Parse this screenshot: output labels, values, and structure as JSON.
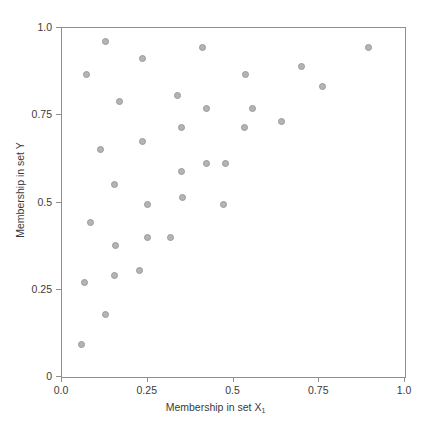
{
  "chart_data": {
    "type": "scatter",
    "title": "",
    "xlabel": "Membership in set X",
    "xlabel_subscript": "1",
    "ylabel": "Membership in set Y",
    "xlim": [
      0.0,
      1.0
    ],
    "ylim": [
      0.0,
      1.0
    ],
    "xticks": [
      0.0,
      0.25,
      0.5,
      0.75,
      1.0
    ],
    "yticks": [
      0.0,
      0.25,
      0.5,
      0.75,
      1.0
    ],
    "xtick_labels": [
      "0.0",
      "0.25",
      "0.5",
      "0.75",
      "1.0"
    ],
    "ytick_labels": [
      "0",
      "0.25",
      "0.5",
      "0.75",
      "1.0"
    ],
    "grid": false,
    "legend": null,
    "marker_color": "#b4b4b4",
    "marker_edge_color": "#9a9a9a",
    "marker_size": 7,
    "axis_color": "#8f8f8f",
    "background": "#ffffff",
    "series": [
      {
        "name": "points",
        "points": [
          [
            0.128,
            0.96
          ],
          [
            0.236,
            0.914
          ],
          [
            0.411,
            0.943
          ],
          [
            0.893,
            0.943
          ],
          [
            0.07,
            0.868
          ],
          [
            0.536,
            0.868
          ],
          [
            0.697,
            0.89
          ],
          [
            0.76,
            0.832
          ],
          [
            0.169,
            0.79
          ],
          [
            0.338,
            0.806
          ],
          [
            0.42,
            0.768
          ],
          [
            0.554,
            0.768
          ],
          [
            0.236,
            0.676
          ],
          [
            0.347,
            0.716
          ],
          [
            0.531,
            0.716
          ],
          [
            0.641,
            0.733
          ],
          [
            0.111,
            0.653
          ],
          [
            0.152,
            0.551
          ],
          [
            0.347,
            0.588
          ],
          [
            0.42,
            0.611
          ],
          [
            0.478,
            0.611
          ],
          [
            0.248,
            0.493
          ],
          [
            0.35,
            0.513
          ],
          [
            0.472,
            0.493
          ],
          [
            0.082,
            0.444
          ],
          [
            0.155,
            0.378
          ],
          [
            0.248,
            0.401
          ],
          [
            0.315,
            0.401
          ],
          [
            0.067,
            0.272
          ],
          [
            0.152,
            0.292
          ],
          [
            0.225,
            0.304
          ],
          [
            0.126,
            0.178
          ],
          [
            0.058,
            0.092
          ]
        ]
      }
    ]
  }
}
